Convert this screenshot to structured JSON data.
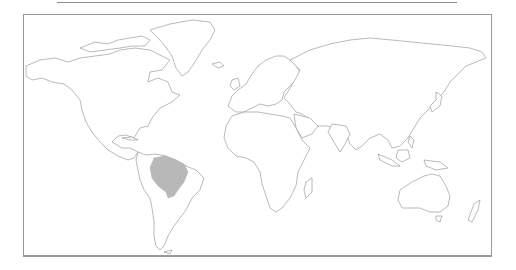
{
  "map": {
    "type": "world-outline-range-map",
    "projection": "equirectangular-like",
    "highlighted_region": {
      "name": "Amazon basin (northern South America)",
      "fill_color": "#b8b8b8"
    },
    "land_fill": "#ffffff",
    "coast_stroke": "#8c8c8c",
    "frame_color": "#9a9a9a",
    "background": "#ffffff"
  }
}
